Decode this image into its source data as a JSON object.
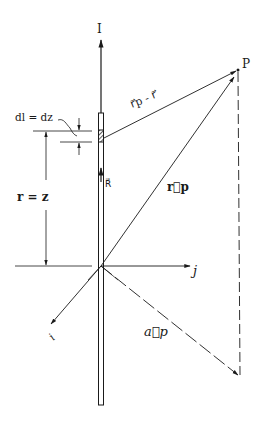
{
  "diagram": {
    "labels": {
      "current": "I",
      "point": "P",
      "element": "dl = dz",
      "r_eq": "r = z",
      "r_p_minus_r": "r⃗p - r⃗",
      "r_p": "r⃗p",
      "R": "R⃗",
      "j": "j",
      "i": "i",
      "a_p": "a⃗p"
    },
    "colors": {
      "ink": "#1a1a1a",
      "background": "#ffffff"
    }
  }
}
